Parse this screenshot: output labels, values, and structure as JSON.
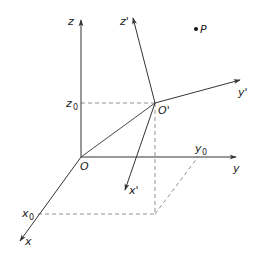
{
  "diagram": {
    "type": "coordinate-frame-translation",
    "colors": {
      "axis": "#333333",
      "dashed": "#777777",
      "text": "#222222",
      "point": "#111111"
    },
    "origin": {
      "label": "O",
      "x": 81,
      "y": 157
    },
    "primed_origin": {
      "label": "O'",
      "x": 155,
      "y": 103
    },
    "axes": {
      "x": {
        "label": "x",
        "tip": [
          20,
          241
        ]
      },
      "y": {
        "label": "y",
        "tip": [
          236,
          157
        ]
      },
      "z": {
        "label": "z",
        "tip": [
          81,
          20
        ]
      },
      "x_prime": {
        "label": "x'",
        "tip": [
          125,
          190
        ]
      },
      "y_prime": {
        "label": "y'",
        "tip": [
          240,
          80
        ]
      },
      "z_prime": {
        "label": "z'",
        "tip": [
          133,
          18
        ]
      }
    },
    "projections": {
      "x0": {
        "label": "x",
        "subscript": "0"
      },
      "y0": {
        "label": "y",
        "subscript": "0"
      },
      "z0": {
        "label": "z",
        "subscript": "0"
      }
    },
    "point": {
      "label": "P",
      "x": 196,
      "y": 29
    }
  }
}
